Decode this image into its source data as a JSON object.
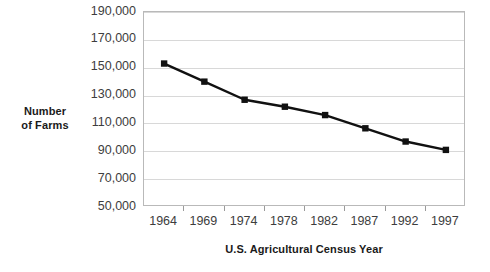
{
  "chart_data": {
    "type": "line",
    "title": "",
    "subtitle": "",
    "xlabel": "U.S. Agricultural Census Year",
    "ylabel": "Number of Farms",
    "ylabel_line1": "Number",
    "ylabel_line2": "of Farms",
    "categories": [
      "1964",
      "1969",
      "1974",
      "1978",
      "1982",
      "1987",
      "1992",
      "1997"
    ],
    "values": [
      153000,
      140000,
      127000,
      122000,
      116000,
      106500,
      97000,
      91000
    ],
    "series": [
      {
        "name": "Number of Farms",
        "values": [
          153000,
          140000,
          127000,
          122000,
          116000,
          106500,
          97000,
          91000
        ]
      }
    ],
    "ytick_labels": [
      "190,000",
      "170,000",
      "150,000",
      "130,000",
      "110,000",
      "90,000",
      "70,000",
      "50,000"
    ],
    "ytick_values": [
      190000,
      170000,
      150000,
      130000,
      110000,
      90000,
      70000,
      50000
    ],
    "ylim": [
      50000,
      190000
    ],
    "grid": true,
    "grid_axis": "y",
    "legend": false,
    "legend_position": "none",
    "marker": "square",
    "line_color": "#111111",
    "marker_color": "#111111",
    "grid_color": "#d8d8d8",
    "plot_border_color": "#b9b9b9",
    "background_color": "#ffffff",
    "tick_label_color": "#3d3d3d",
    "axis_title_color": "#1a1a1a"
  }
}
